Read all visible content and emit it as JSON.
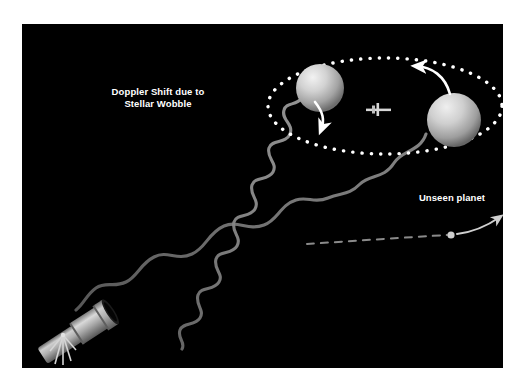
{
  "figure": {
    "background_color": "#ffffff",
    "scene_color": "#000000",
    "title_visible": false
  },
  "labels": {
    "doppler_line1": "Doppler Shift due to",
    "doppler_line2": "Stellar Wobble",
    "unseen_planet": "Unseen planet"
  },
  "colors": {
    "text": "#ffffff",
    "orbit_dots": "#ffffff",
    "arrow": "#ffffff",
    "wave": "#7a7a7a",
    "star_light": "#e8e8e8",
    "star_mid": "#b9b9b9",
    "star_dark": "#6a6a6a",
    "telescope_light": "#d8d8d8",
    "telescope_mid": "#9a9a9a",
    "telescope_dark": "#4a4a4a",
    "planet_path": "#6f6f6f",
    "planet_dot": "#c9c9c9"
  },
  "elements": {
    "star_near": {
      "name": "star-upper-left",
      "cx": 298,
      "cy": 64,
      "r": 24
    },
    "star_far": {
      "name": "star-lower-right",
      "cx": 432,
      "cy": 96,
      "r": 27
    },
    "center_of_mass": {
      "name": "center-of-mass-marker",
      "x": 356,
      "y": 86
    },
    "orbit": {
      "name": "stellar-wobble-orbit",
      "cx": 363,
      "cy": 82,
      "rx": 117,
      "ry": 48,
      "dot_count": 54
    },
    "wave_blueshift": {
      "name": "blueshifted-light-wave",
      "wavelength_px": 26,
      "amplitude_px": 13
    },
    "wave_redshift": {
      "name": "redshifted-light-wave",
      "wavelength_px": 56,
      "amplitude_px": 17
    },
    "telescope": {
      "name": "telescope",
      "angle_deg": -34
    },
    "planet_track": {
      "name": "unseen-planet-dashed-path"
    },
    "planet_marker": {
      "name": "unseen-planet-dot",
      "x": 428,
      "y": 213
    }
  }
}
